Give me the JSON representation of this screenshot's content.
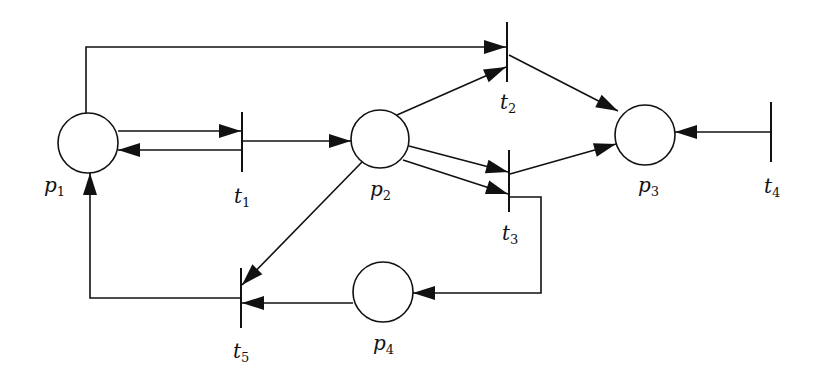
{
  "diagram": {
    "stroke": "#111111",
    "fill": "#ffffff",
    "places": [
      {
        "id": "p1",
        "name": "p",
        "sub": "1",
        "cx": 88,
        "cy": 143,
        "r": 30,
        "lx": 44,
        "ly": 192
      },
      {
        "id": "p2",
        "name": "p",
        "sub": "2",
        "cx": 380,
        "cy": 139,
        "r": 29,
        "lx": 370,
        "ly": 196
      },
      {
        "id": "p3",
        "name": "p",
        "sub": "3",
        "cx": 645,
        "cy": 135,
        "r": 30,
        "lx": 638,
        "ly": 192
      },
      {
        "id": "p4",
        "name": "p",
        "sub": "4",
        "cx": 383,
        "cy": 292,
        "r": 30,
        "lx": 373,
        "ly": 350
      }
    ],
    "transitions": [
      {
        "id": "t1",
        "name": "t",
        "sub": "1",
        "x": 242,
        "y1": 112,
        "y2": 172,
        "lx": 234,
        "ly": 203
      },
      {
        "id": "t2",
        "name": "t",
        "sub": "2",
        "x": 507,
        "y1": 22,
        "y2": 82,
        "lx": 500,
        "ly": 109
      },
      {
        "id": "t3",
        "name": "t",
        "sub": "3",
        "x": 509,
        "y1": 150,
        "y2": 212,
        "lx": 502,
        "ly": 240
      },
      {
        "id": "t4",
        "name": "t",
        "sub": "4",
        "x": 771,
        "y1": 102,
        "y2": 162,
        "lx": 764,
        "ly": 193
      },
      {
        "id": "t5",
        "name": "t",
        "sub": "5",
        "x": 241,
        "y1": 268,
        "y2": 328,
        "lx": 233,
        "ly": 358
      }
    ],
    "arcs": [
      {
        "from": "p1",
        "to": "t2",
        "points": [
          [
            86,
            113
          ],
          [
            86,
            47
          ],
          [
            506,
            47
          ]
        ]
      },
      {
        "from": "p1",
        "to": "t1",
        "points": [
          [
            118,
            131
          ],
          [
            241,
            131
          ]
        ]
      },
      {
        "from": "t1",
        "to": "p1",
        "points": [
          [
            241,
            150
          ],
          [
            118,
            150
          ]
        ]
      },
      {
        "from": "t1",
        "to": "p2",
        "points": [
          [
            243,
            141
          ],
          [
            351,
            141
          ]
        ]
      },
      {
        "from": "p2",
        "to": "t2",
        "points": [
          [
            397,
            115
          ],
          [
            506,
            67
          ]
        ]
      },
      {
        "from": "p2",
        "to": "t3",
        "points": [
          [
            409,
            146
          ],
          [
            508,
            172
          ]
        ]
      },
      {
        "from": "p2",
        "to": "t3",
        "points": [
          [
            403,
            160
          ],
          [
            508,
            194
          ]
        ]
      },
      {
        "from": "p2",
        "to": "t5",
        "points": [
          [
            362,
            162
          ],
          [
            242,
            285
          ]
        ]
      },
      {
        "from": "t2",
        "to": "p3",
        "points": [
          [
            509,
            55
          ],
          [
            618,
            111
          ]
        ]
      },
      {
        "from": "t3",
        "to": "p3",
        "points": [
          [
            510,
            174
          ],
          [
            616,
            144
          ]
        ]
      },
      {
        "from": "t4",
        "to": "p3",
        "points": [
          [
            770,
            132
          ],
          [
            675,
            132
          ]
        ]
      },
      {
        "from": "t3",
        "to": "p4",
        "points": [
          [
            510,
            197
          ],
          [
            541,
            197
          ],
          [
            541,
            293
          ],
          [
            413,
            293
          ]
        ]
      },
      {
        "from": "p4",
        "to": "t5",
        "points": [
          [
            353,
            303
          ],
          [
            242,
            303
          ]
        ]
      },
      {
        "from": "t5",
        "to": "p1",
        "points": [
          [
            240,
            298
          ],
          [
            90,
            298
          ],
          [
            90,
            173
          ]
        ]
      }
    ]
  }
}
